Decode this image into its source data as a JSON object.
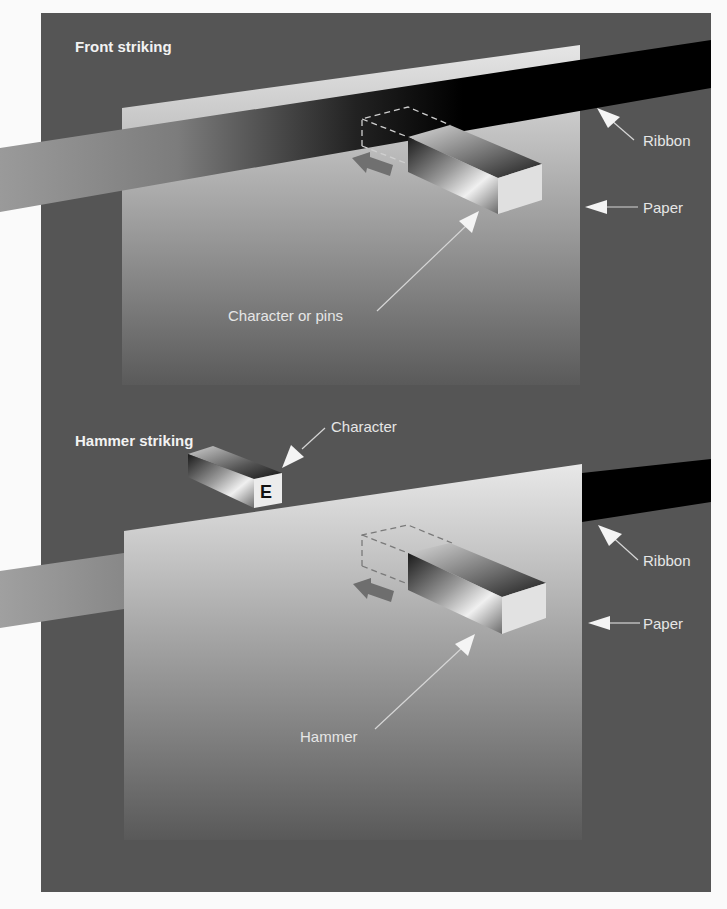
{
  "figure": {
    "background": "#555555",
    "page_background": "#fafafa",
    "panels": [
      {
        "title": "Front striking",
        "labels": {
          "ribbon": "Ribbon",
          "paper": "Paper",
          "striker": "Character or pins"
        },
        "description": "Ribbon passes in front of paper; character/pins strike from front"
      },
      {
        "title": "Hammer striking",
        "labels": {
          "character": "Character",
          "character_glyph": "E",
          "ribbon": "Ribbon",
          "paper": "Paper",
          "striker": "Hammer"
        },
        "description": "Ribbon passes behind paper; hammer strikes paper from front against character"
      }
    ],
    "colors": {
      "frame": "#555555",
      "paper_light": "#e4e4e4",
      "paper_dark": "#5a5a5a",
      "ribbon_dark": "#000000",
      "ribbon_light": "#9a9a9a",
      "label_text": "#e6e6e6",
      "arrow_white": "#f4f4f4",
      "motion_arrow": "#6e6e6e"
    }
  }
}
